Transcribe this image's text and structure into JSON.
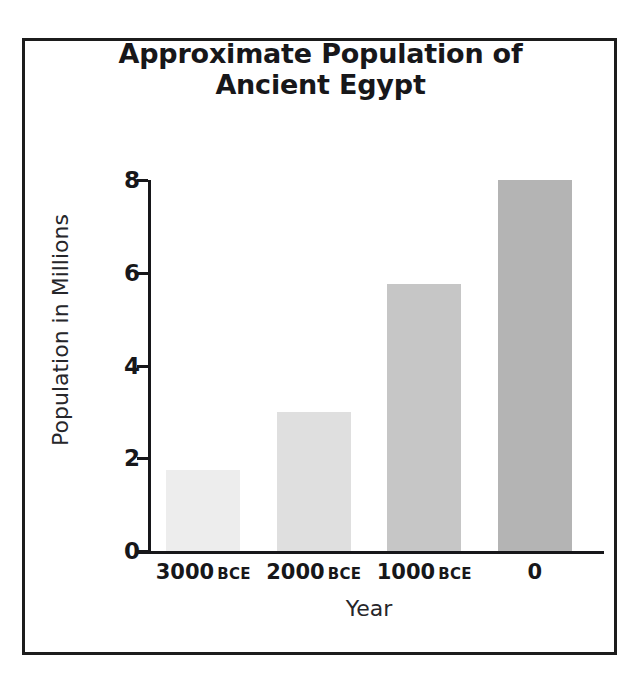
{
  "figure": {
    "frame_color": "#1c1c1c",
    "background": "#ffffff"
  },
  "chart_data": {
    "type": "bar",
    "title": "Approximate Population of Ancient Egypt",
    "title_lines": [
      "Approximate Population of",
      "Ancient Egypt"
    ],
    "xlabel": "Year",
    "ylabel": "Population in Millions",
    "categories": [
      "3000 BCE",
      "2000 BCE",
      "1000 BCE",
      "0"
    ],
    "category_parts": [
      {
        "number": "3000",
        "era": "BCE"
      },
      {
        "number": "2000",
        "era": "BCE"
      },
      {
        "number": "1000",
        "era": "BCE"
      },
      {
        "number": "0",
        "era": ""
      }
    ],
    "values": [
      1.75,
      3.0,
      5.75,
      8.0
    ],
    "bar_colors": [
      "#ededed",
      "#dfdfdf",
      "#c6c6c6",
      "#b4b4b4"
    ],
    "ylim": [
      0,
      8
    ],
    "yticks": [
      0,
      2,
      4,
      6,
      8
    ],
    "ytick_labels": [
      "0",
      "2",
      "4",
      "6",
      "8"
    ],
    "grid": false,
    "legend": "none",
    "axis_color": "#17171a"
  }
}
